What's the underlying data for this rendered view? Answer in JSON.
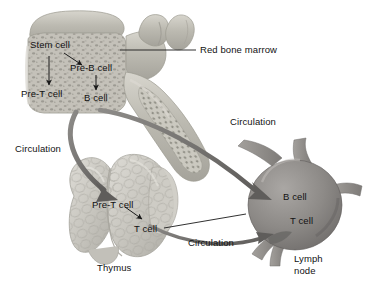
{
  "diagram": {
    "background_color": "#ffffff",
    "text_color": "#121212",
    "structures": [
      {
        "id": "red-bone-marrow",
        "name": "Red bone marrow",
        "label": "Red bone marrow",
        "fill_color": "#b9b7ae",
        "description": "Vertebra with cut spongy bone showing red marrow"
      },
      {
        "id": "thymus",
        "name": "Thymus",
        "label": "Thymus",
        "fill_color": "#c9c8c2",
        "description": "Bilobed lobulated gland"
      },
      {
        "id": "lymph-node",
        "name": "Lymph node",
        "label": "Lymph node",
        "label_line_1": "Lymph",
        "label_line_2": "node",
        "fill_color": "#8e8b88",
        "description": "Bean shaped node with afferent and efferent vessels"
      }
    ],
    "cell_labels": [
      {
        "id": "stem-cell",
        "text": "Stem cell",
        "location": "red-bone-marrow"
      },
      {
        "id": "pre-b-cell",
        "text": "Pre-B cell",
        "location": "red-bone-marrow"
      },
      {
        "id": "pre-t-cell-marrow",
        "text": "Pre-T cell",
        "location": "red-bone-marrow"
      },
      {
        "id": "b-cell-marrow",
        "text": "B cell",
        "location": "red-bone-marrow"
      },
      {
        "id": "pre-t-cell-thymus",
        "text": "Pre-T cell",
        "location": "thymus"
      },
      {
        "id": "t-cell-thymus",
        "text": "T cell",
        "location": "thymus"
      },
      {
        "id": "b-cell-node",
        "text": "B cell",
        "location": "lymph-node"
      },
      {
        "id": "t-cell-node",
        "text": "T cell",
        "location": "lymph-node"
      }
    ],
    "flow_labels": [
      {
        "id": "circulation-marrow-to-node",
        "text": "Circulation"
      },
      {
        "id": "circulation-marrow-to-thymus",
        "text": "Circulation"
      },
      {
        "id": "circulation-thymus-to-node",
        "text": "Circulation"
      }
    ],
    "arrow_color": "#6e6c6a",
    "leader_line_color": "#1a1a1a"
  }
}
